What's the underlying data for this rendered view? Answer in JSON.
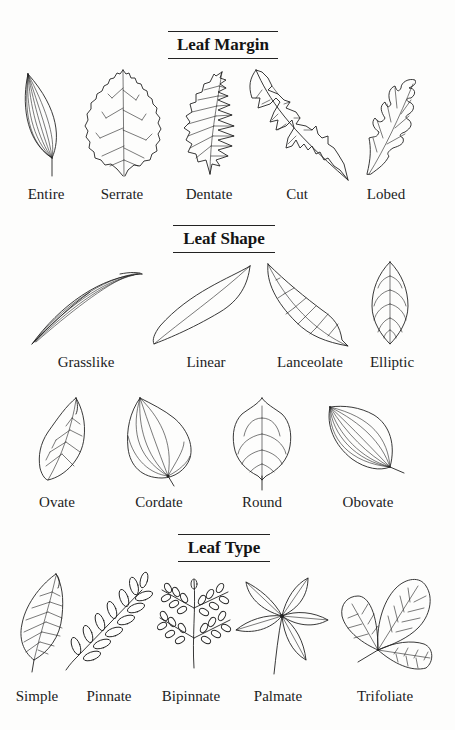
{
  "sections": [
    {
      "title": "Leaf Margin",
      "items": [
        {
          "label": "Entire",
          "icon": "entire-leaf-icon"
        },
        {
          "label": "Serrate",
          "icon": "serrate-leaf-icon"
        },
        {
          "label": "Dentate",
          "icon": "dentate-leaf-icon"
        },
        {
          "label": "Cut",
          "icon": "cut-leaf-icon"
        },
        {
          "label": "Lobed",
          "icon": "lobed-leaf-icon"
        }
      ]
    },
    {
      "title": "Leaf Shape",
      "items": [
        {
          "label": "Grasslike",
          "icon": "grasslike-leaf-icon"
        },
        {
          "label": "Linear",
          "icon": "linear-leaf-icon"
        },
        {
          "label": "Lanceolate",
          "icon": "lanceolate-leaf-icon"
        },
        {
          "label": "Elliptic",
          "icon": "elliptic-leaf-icon"
        },
        {
          "label": "Ovate",
          "icon": "ovate-leaf-icon"
        },
        {
          "label": "Cordate",
          "icon": "cordate-leaf-icon"
        },
        {
          "label": "Round",
          "icon": "round-leaf-icon"
        },
        {
          "label": "Obovate",
          "icon": "obovate-leaf-icon"
        }
      ]
    },
    {
      "title": "Leaf Type",
      "items": [
        {
          "label": "Simple",
          "icon": "simple-leaf-icon"
        },
        {
          "label": "Pinnate",
          "icon": "pinnate-leaf-icon"
        },
        {
          "label": "Bipinnate",
          "icon": "bipinnate-leaf-icon"
        },
        {
          "label": "Palmate",
          "icon": "palmate-leaf-icon"
        },
        {
          "label": "Trifoliate",
          "icon": "trifoliate-leaf-icon"
        }
      ]
    }
  ]
}
